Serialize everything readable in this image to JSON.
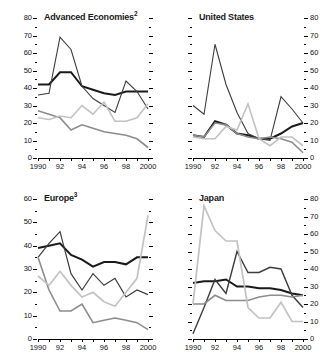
{
  "figure": {
    "background": "#ffffff",
    "x_tick_labels": [
      "1990",
      "",
      "92",
      "",
      "94",
      "",
      "96",
      "",
      "98",
      "",
      "2000"
    ],
    "x_years": [
      1990,
      1991,
      1992,
      1993,
      1994,
      1995,
      1996,
      1997,
      1998,
      1999,
      2000
    ]
  },
  "colors": {
    "series_1": "#1a1a1a",
    "series_2": "#3d3d3d",
    "series_3": "#8c8c8c",
    "series_4": "#c2c2c2",
    "axis": "#000000",
    "text": "#111111"
  },
  "panels": [
    {
      "id": "advanced-economies",
      "title": "Advanced Economies",
      "title_sup": "2",
      "axis_side": "left",
      "ylim": [
        0,
        80
      ],
      "yticks": [
        0,
        10,
        20,
        30,
        40,
        50,
        60,
        70,
        80
      ],
      "ytick_labels": [
        "0",
        "10",
        "20",
        "30",
        "40",
        "50",
        "60",
        "70",
        "80"
      ]
    },
    {
      "id": "united-states",
      "title": "United States",
      "title_sup": "",
      "axis_side": "right",
      "ylim": [
        0,
        80
      ],
      "yticks": [
        0,
        10,
        20,
        30,
        40,
        50,
        60,
        70,
        80
      ],
      "ytick_labels": [
        "0",
        "10",
        "20",
        "30",
        "40",
        "50",
        "60",
        "70",
        "80"
      ]
    },
    {
      "id": "europe",
      "title": "Europe",
      "title_sup": "3",
      "axis_side": "left",
      "ylim": [
        0,
        60
      ],
      "yticks": [
        0,
        10,
        20,
        30,
        40,
        50,
        60
      ],
      "ytick_labels": [
        "0",
        "10",
        "20",
        "30",
        "40",
        "50",
        "60"
      ]
    },
    {
      "id": "japan",
      "title": "Japan",
      "title_sup": "",
      "axis_side": "right",
      "ylim": [
        0,
        80
      ],
      "yticks": [
        0,
        10,
        20,
        30,
        40,
        50,
        60,
        70,
        80
      ],
      "ytick_labels": [
        "0",
        "10",
        "20",
        "30",
        "40",
        "50",
        "60",
        "70",
        "80"
      ]
    }
  ],
  "chart_data": [
    {
      "type": "line",
      "title": "Advanced Economies2",
      "xlabel": "",
      "ylabel": "",
      "x": [
        1990,
        1991,
        1992,
        1993,
        1994,
        1995,
        1996,
        1997,
        1998,
        1999,
        2000
      ],
      "xlim": [
        1990,
        2000
      ],
      "ylim": [
        0,
        80
      ],
      "grid": false,
      "legend": "none",
      "series": [
        {
          "name": "series-1",
          "color": "#1a1a1a",
          "width": 2.0,
          "values": [
            42,
            42,
            49,
            49,
            41,
            39,
            37,
            36,
            38,
            38,
            38
          ]
        },
        {
          "name": "series-2",
          "color": "#3d3d3d",
          "width": 1.1,
          "values": [
            36,
            37,
            69,
            62,
            41,
            34,
            30,
            26,
            44,
            38,
            28
          ]
        },
        {
          "name": "series-3",
          "color": "#8c8c8c",
          "width": 1.6,
          "values": [
            27,
            25,
            23,
            16,
            19,
            17,
            15,
            14,
            13,
            11,
            6
          ]
        },
        {
          "name": "series-4",
          "color": "#c2c2c2",
          "width": 1.6,
          "values": [
            23,
            22,
            24,
            23,
            30,
            25,
            32,
            21,
            21,
            23,
            31
          ]
        }
      ]
    },
    {
      "type": "line",
      "title": "United States",
      "xlabel": "",
      "ylabel": "",
      "x": [
        1990,
        1991,
        1992,
        1993,
        1994,
        1995,
        1996,
        1997,
        1998,
        1999,
        2000
      ],
      "xlim": [
        1990,
        2000
      ],
      "ylim": [
        0,
        80
      ],
      "grid": false,
      "legend": "none",
      "series": [
        {
          "name": "series-1",
          "color": "#1a1a1a",
          "width": 2.0,
          "values": [
            13,
            12,
            21,
            19,
            14,
            13,
            11,
            11,
            14,
            18,
            20
          ]
        },
        {
          "name": "series-2",
          "color": "#3d3d3d",
          "width": 1.1,
          "values": [
            30,
            25,
            65,
            42,
            26,
            14,
            11,
            10,
            35,
            28,
            20
          ]
        },
        {
          "name": "series-3",
          "color": "#8c8c8c",
          "width": 1.5,
          "values": [
            13,
            12,
            20,
            19,
            14,
            12,
            11,
            12,
            11,
            9,
            3
          ]
        },
        {
          "name": "series-4",
          "color": "#c2c2c2",
          "width": 1.6,
          "values": [
            12,
            11,
            11,
            18,
            16,
            31,
            11,
            7,
            12,
            12,
            7
          ]
        }
      ]
    },
    {
      "type": "line",
      "title": "Europe3",
      "xlabel": "",
      "ylabel": "",
      "x": [
        1990,
        1991,
        1992,
        1993,
        1994,
        1995,
        1996,
        1997,
        1998,
        1999,
        2000
      ],
      "xlim": [
        1990,
        2000
      ],
      "ylim": [
        0,
        60
      ],
      "grid": false,
      "legend": "none",
      "series": [
        {
          "name": "series-1",
          "color": "#1a1a1a",
          "width": 2.0,
          "values": [
            39,
            40,
            41,
            36,
            34,
            31,
            33,
            33,
            32,
            35,
            35
          ]
        },
        {
          "name": "series-2",
          "color": "#3d3d3d",
          "width": 1.2,
          "values": [
            35,
            41,
            46,
            28,
            21,
            28,
            23,
            26,
            18,
            21,
            19
          ]
        },
        {
          "name": "series-3",
          "color": "#8c8c8c",
          "width": 1.6,
          "values": [
            35,
            21,
            12,
            12,
            15,
            7,
            8,
            9,
            8,
            7,
            4
          ]
        },
        {
          "name": "series-4",
          "color": "#c2c2c2",
          "width": 1.7,
          "values": [
            27,
            23,
            29,
            23,
            18,
            20,
            16,
            14,
            20,
            26,
            53
          ]
        }
      ]
    },
    {
      "type": "line",
      "title": "Japan",
      "xlabel": "",
      "ylabel": "",
      "x": [
        1990,
        1991,
        1992,
        1993,
        1994,
        1995,
        1996,
        1997,
        1998,
        1999,
        2000
      ],
      "xlim": [
        1990,
        2000
      ],
      "ylim": [
        0,
        80
      ],
      "grid": false,
      "legend": "none",
      "series": [
        {
          "name": "series-1",
          "color": "#1a1a1a",
          "width": 2.0,
          "values": [
            32,
            33,
            33,
            34,
            30,
            30,
            29,
            29,
            28,
            26,
            25
          ]
        },
        {
          "name": "series-2",
          "color": "#3d3d3d",
          "width": 1.4,
          "values": [
            3,
            18,
            34,
            26,
            50,
            38,
            38,
            41,
            40,
            25,
            18
          ]
        },
        {
          "name": "series-3",
          "color": "#8c8c8c",
          "width": 1.6,
          "values": [
            20,
            20,
            25,
            22,
            22,
            22,
            24,
            25,
            25,
            24,
            25
          ]
        },
        {
          "name": "series-4",
          "color": "#c2c2c2",
          "width": 1.7,
          "values": [
            20,
            76,
            62,
            56,
            56,
            18,
            12,
            12,
            21,
            10,
            10
          ]
        }
      ]
    }
  ]
}
